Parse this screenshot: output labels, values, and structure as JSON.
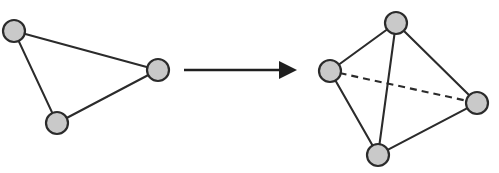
{
  "figure": {
    "background_color": "#ffffff",
    "node_fill_color": "#c9c9c9",
    "node_stroke_color": "#2b2b2b",
    "edge_color": "#2b2b2b",
    "arrow_color": "#1f1f1f",
    "node_radius": 11
  },
  "left_shape": {
    "name": "triangle",
    "label": "2-simplex",
    "node_count": 3,
    "edge_count": 3,
    "nodes": [
      {
        "id": "L1",
        "name": "triangle-node-top-left",
        "cx": 14,
        "cy": 31,
        "r": 11
      },
      {
        "id": "L2",
        "name": "triangle-node-bottom-left",
        "cx": 57,
        "cy": 123,
        "r": 11
      },
      {
        "id": "L3",
        "name": "triangle-node-right",
        "cx": 158,
        "cy": 70,
        "r": 11
      }
    ],
    "edges": [
      {
        "name": "triangle-edge-top-left-to-right",
        "from": "L1",
        "to": "L3",
        "style": "solid"
      },
      {
        "name": "triangle-edge-top-left-to-bottom-left",
        "from": "L1",
        "to": "L2",
        "style": "solid"
      },
      {
        "name": "triangle-edge-bottom-left-to-right",
        "from": "L2",
        "to": "L3",
        "style": "solid"
      }
    ]
  },
  "arrow": {
    "name": "transformation-arrow",
    "direction": "right",
    "label": "",
    "x1": 184,
    "y1": 70,
    "x2": 279,
    "y2": 70,
    "head_tip_x": 297,
    "head_half_height": 9
  },
  "right_shape": {
    "name": "tetrahedron",
    "label": "3-simplex",
    "node_count": 4,
    "edge_count": 6,
    "nodes": [
      {
        "id": "R1",
        "name": "tetrahedron-node-top",
        "cx": 396,
        "cy": 23,
        "r": 11
      },
      {
        "id": "R2",
        "name": "tetrahedron-node-left",
        "cx": 330,
        "cy": 71,
        "r": 11
      },
      {
        "id": "R3",
        "name": "tetrahedron-node-right",
        "cx": 477,
        "cy": 103,
        "r": 11
      },
      {
        "id": "R4",
        "name": "tetrahedron-node-bottom",
        "cx": 378,
        "cy": 155,
        "r": 11
      }
    ],
    "edges": [
      {
        "name": "tetrahedron-edge-top-to-left",
        "from": "R1",
        "to": "R2",
        "style": "solid"
      },
      {
        "name": "tetrahedron-edge-top-to-right",
        "from": "R1",
        "to": "R3",
        "style": "solid"
      },
      {
        "name": "tetrahedron-edge-top-to-bottom",
        "from": "R1",
        "to": "R4",
        "style": "solid"
      },
      {
        "name": "tetrahedron-edge-left-to-bottom",
        "from": "R2",
        "to": "R4",
        "style": "solid"
      },
      {
        "name": "tetrahedron-edge-right-to-bottom",
        "from": "R3",
        "to": "R4",
        "style": "solid"
      },
      {
        "name": "tetrahedron-edge-left-to-right-hidden",
        "from": "R2",
        "to": "R3",
        "style": "dashed"
      }
    ]
  }
}
